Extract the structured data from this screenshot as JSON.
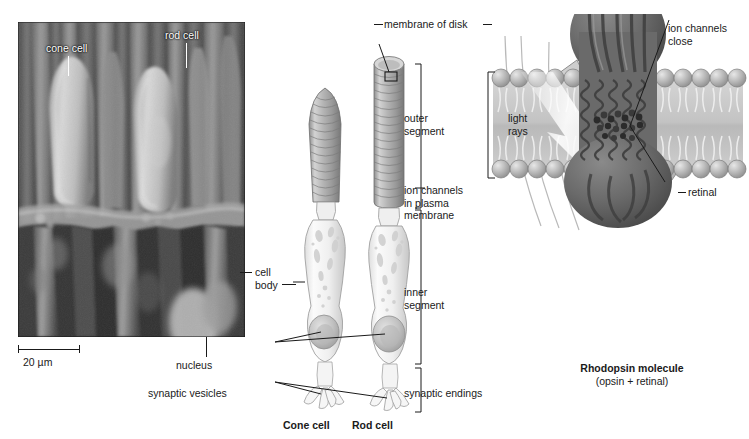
{
  "figure": {
    "panels": [
      "electron-micrograph",
      "cell-anatomy-diagram",
      "rhodopsin-membrane-diagram"
    ]
  },
  "micrograph": {
    "labels": [
      {
        "id": "cone-cell",
        "text": "cone cell"
      },
      {
        "id": "rod-cell",
        "text": "rod cell"
      }
    ],
    "scale_bar": {
      "text": "20 µm",
      "value": 20,
      "unit": "µm"
    }
  },
  "cell_diagram": {
    "callouts": [
      {
        "id": "membrane-of-disk",
        "text": "membrane of disk"
      },
      {
        "id": "outer-segment",
        "text": "outer\nsegment"
      },
      {
        "id": "ion-channels-plasma-membrane",
        "text": "ion channels\nin plasma\nmembrane"
      },
      {
        "id": "cell-body",
        "text": "cell\nbody"
      },
      {
        "id": "inner-segment",
        "text": "inner\nsegment"
      },
      {
        "id": "nucleus",
        "text": "nucleus"
      },
      {
        "id": "synaptic-vesicles",
        "text": "synaptic vesicles"
      },
      {
        "id": "synaptic-endings",
        "text": "synaptic endings"
      }
    ],
    "captions": [
      {
        "id": "cone-cell-caption",
        "text": "Cone cell"
      },
      {
        "id": "rod-cell-caption",
        "text": "Rod cell"
      }
    ]
  },
  "rhodopsin_panel": {
    "light_rays_label": "light\nrays",
    "cascade_label": "cascade  of reactions",
    "ion_channels_close_label": "ion channels\nclose",
    "retinal_label": "retinal",
    "molecule_name": "Rhodopsin molecule",
    "molecule_components": "(opsin + retinal)"
  },
  "colors": {
    "ink": "#1a1a1a",
    "paper": "#ffffff",
    "cell_fill_light": "#f2f2f2",
    "cell_fill_mid": "#c9c9c9",
    "cell_fill_dark": "#9a9a9a",
    "membrane_head": "#b0b0b0",
    "membrane_body": "#cfcfcf",
    "protein_dark": "#6d6d6d",
    "protein_darker": "#4f4f4f",
    "arrow_gray": "#c0c0c0",
    "micrograph_bg": "#5a5a5a"
  }
}
